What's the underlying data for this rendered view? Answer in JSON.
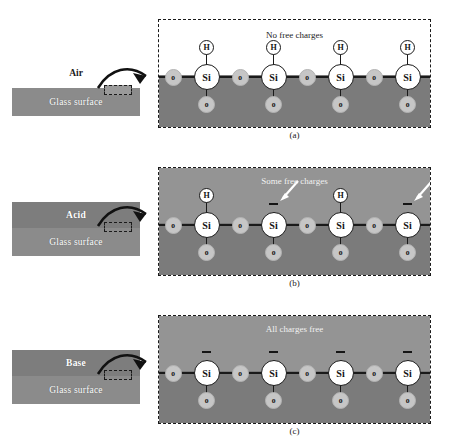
{
  "figure": {
    "panels": [
      {
        "id": "a",
        "caption": "(a)",
        "medium_label": "Air",
        "glass_label": "Glass surface",
        "headline": "No free charges",
        "headline_style": "dark",
        "upper_fill": "white",
        "medium_is_band": false,
        "si_atoms": [
          {
            "hydrogen": true,
            "charge": "",
            "arrow": false
          },
          {
            "hydrogen": true,
            "charge": "",
            "arrow": false
          },
          {
            "hydrogen": true,
            "charge": "",
            "arrow": false
          },
          {
            "hydrogen": true,
            "charge": "",
            "arrow": false
          }
        ]
      },
      {
        "id": "b",
        "caption": "(b)",
        "medium_label": "Acid",
        "glass_label": "Glass surface",
        "headline": "Some free charges",
        "headline_style": "light",
        "upper_fill": "gray",
        "medium_is_band": true,
        "si_atoms": [
          {
            "hydrogen": true,
            "charge": "",
            "arrow": false
          },
          {
            "hydrogen": false,
            "charge": "−",
            "arrow": true
          },
          {
            "hydrogen": true,
            "charge": "",
            "arrow": false
          },
          {
            "hydrogen": false,
            "charge": "−",
            "arrow": true
          }
        ]
      },
      {
        "id": "c",
        "caption": "(c)",
        "medium_label": "Base",
        "glass_label": "Glass surface",
        "headline": "All charges free",
        "headline_style": "light",
        "upper_fill": "gray",
        "medium_is_band": true,
        "si_atoms": [
          {
            "hydrogen": false,
            "charge": "−",
            "arrow": false
          },
          {
            "hydrogen": false,
            "charge": "−",
            "arrow": false
          },
          {
            "hydrogen": false,
            "charge": "−",
            "arrow": false
          },
          {
            "hydrogen": false,
            "charge": "−",
            "arrow": false
          }
        ]
      }
    ],
    "atom_labels": {
      "silicon": "Si",
      "oxygen": "o",
      "hydrogen": "H"
    },
    "colors": {
      "glass_body": "#7b7b7b",
      "medium_band": "#7d7d7d",
      "glass_band": "#8b8b8b",
      "solution_fill": "#949494",
      "oxygen": "#c6c6c6",
      "silicon": "#ffffff",
      "outline": "#1a1a1a"
    }
  }
}
